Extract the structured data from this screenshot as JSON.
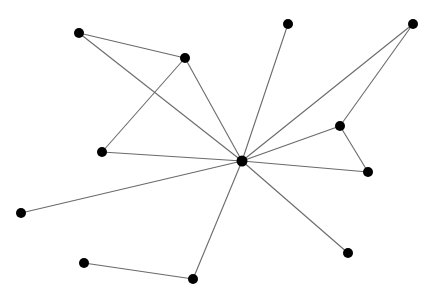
{
  "graph": {
    "background": "#ffffff",
    "edge_color": "#6a6a6a",
    "node_color": "#000000",
    "node_radius": 5,
    "nodes": [
      {
        "id": "hub",
        "x": 242,
        "y": 161
      },
      {
        "id": "A",
        "x": 79,
        "y": 33
      },
      {
        "id": "B",
        "x": 185,
        "y": 58
      },
      {
        "id": "C",
        "x": 102,
        "y": 152
      },
      {
        "id": "D",
        "x": 288,
        "y": 24
      },
      {
        "id": "E",
        "x": 413,
        "y": 24
      },
      {
        "id": "F",
        "x": 340,
        "y": 126
      },
      {
        "id": "G",
        "x": 368,
        "y": 172
      },
      {
        "id": "H",
        "x": 21,
        "y": 213
      },
      {
        "id": "I",
        "x": 348,
        "y": 253
      },
      {
        "id": "J",
        "x": 84,
        "y": 263
      },
      {
        "id": "K",
        "x": 193,
        "y": 279
      }
    ],
    "edges": [
      [
        "A",
        "B"
      ],
      [
        "A",
        "hub"
      ],
      [
        "B",
        "C"
      ],
      [
        "B",
        "hub"
      ],
      [
        "C",
        "hub"
      ],
      [
        "D",
        "hub"
      ],
      [
        "E",
        "hub"
      ],
      [
        "E",
        "F"
      ],
      [
        "F",
        "hub"
      ],
      [
        "F",
        "G"
      ],
      [
        "G",
        "hub"
      ],
      [
        "H",
        "hub"
      ],
      [
        "I",
        "hub"
      ],
      [
        "K",
        "hub"
      ],
      [
        "J",
        "K"
      ]
    ]
  }
}
